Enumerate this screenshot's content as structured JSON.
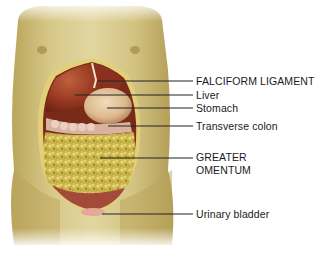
{
  "diagram": {
    "colors": {
      "skin": "#c9b56e",
      "skin_light": "#e6dcaa",
      "liver": "#9c3a22",
      "stomach": "#e7c9a2",
      "omentum": "#c9b44a",
      "cavity_edge": "#e3cf77",
      "leader_line": "#222222"
    },
    "labels": [
      {
        "id": "falciform",
        "text": "FALCIFORM LIGAMENT",
        "x": 196,
        "y": 75,
        "line_from_x": 97,
        "line_y": 81
      },
      {
        "id": "liver",
        "text": "Liver",
        "x": 196,
        "y": 89,
        "line_from_x": 75,
        "line_y": 95
      },
      {
        "id": "stomach",
        "text": "Stomach",
        "x": 196,
        "y": 102,
        "line_from_x": 107,
        "line_y": 108
      },
      {
        "id": "transverse_colon",
        "text": "Transverse colon",
        "x": 196,
        "y": 120,
        "line_from_x": 108,
        "line_y": 126
      },
      {
        "id": "greater_omentum_1",
        "text": "GREATER",
        "x": 196,
        "y": 151,
        "line_from_x": 100,
        "line_y": 158
      },
      {
        "id": "greater_omentum_2",
        "text": "OMENTUM",
        "x": 196,
        "y": 164
      },
      {
        "id": "urinary_bladder",
        "text": "Urinary bladder",
        "x": 196,
        "y": 208,
        "line_from_x": 102,
        "line_y": 214
      }
    ]
  }
}
